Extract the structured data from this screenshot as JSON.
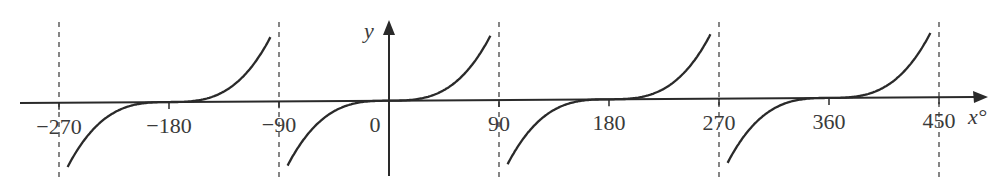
{
  "chart_data": {
    "type": "line",
    "title": "",
    "function": "y = tan(x) shape (cubic-like flattening at zeros)",
    "xlabel": "x°",
    "ylabel": "y",
    "x_ticks": [
      -270,
      -180,
      -90,
      0,
      90,
      180,
      270,
      360,
      450
    ],
    "x_tick_labels": [
      "−270",
      "−180",
      "−90",
      "0",
      "90",
      "180",
      "270",
      "360",
      "450"
    ],
    "asymptotes": [
      -270,
      -90,
      90,
      270,
      450
    ],
    "zeros": [
      -180,
      0,
      180,
      360
    ],
    "xlim": [
      -295,
      490
    ],
    "grid": false,
    "series": [
      {
        "name": "curve",
        "branches": [
          [
            -270,
            -90
          ],
          [
            -90,
            90
          ],
          [
            90,
            270
          ],
          [
            270,
            450
          ]
        ]
      }
    ],
    "colors": {
      "curve": "#2a2a2a",
      "axis": "#2a2a2a",
      "asymptote": "#444444"
    }
  }
}
